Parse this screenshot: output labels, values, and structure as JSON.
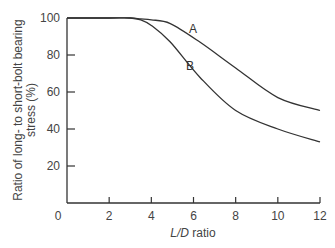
{
  "chart_data": {
    "type": "line",
    "title": "",
    "xlabel": "L/D ratio",
    "xlabel_italic_part": "L/D",
    "xlabel_rest": " ratio",
    "ylabel_line1": "Ratio of long- to short-bolt bearing",
    "ylabel_line2": "stress (%)",
    "xlim": [
      0,
      12
    ],
    "ylim": [
      0,
      100
    ],
    "x_ticks": [
      "0",
      "2",
      "4",
      "6",
      "8",
      "10",
      "12"
    ],
    "y_ticks": [
      "20",
      "40",
      "60",
      "80",
      "100"
    ],
    "grid": false,
    "legend": "inline labels",
    "series": [
      {
        "name": "A",
        "x": [
          0,
          2,
          3,
          3.5,
          4,
          4.9,
          6.3,
          8,
          8.2,
          10,
          12
        ],
        "values": [
          100,
          100,
          100,
          99.5,
          99,
          97,
          87,
          73,
          71,
          57,
          50
        ]
      },
      {
        "name": "B",
        "x": [
          0,
          2,
          3,
          3.5,
          4,
          4.9,
          6.3,
          8,
          8.2,
          10,
          12
        ],
        "values": [
          100,
          100,
          100,
          99,
          96,
          87,
          68,
          50,
          52,
          40,
          33
        ]
      }
    ]
  }
}
